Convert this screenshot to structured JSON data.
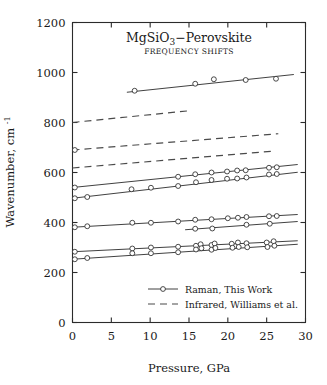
{
  "chart_data": {
    "type": "line",
    "title": "MgSiO3−Perovskite",
    "subtitle": "FREQUENCY SHIFTS",
    "xlabel": "Pressure, GPa",
    "ylabel": "Wavenumber, cm⁻¹",
    "xlim": [
      0,
      30
    ],
    "ylim": [
      0,
      1200
    ],
    "xticks": [
      0,
      5,
      10,
      15,
      20,
      25,
      30
    ],
    "yticks": [
      0,
      200,
      400,
      600,
      800,
      1000,
      1200
    ],
    "grid": false,
    "legend_position": "lower-right-inside",
    "legend": [
      {
        "label": "Raman, This Work",
        "style": "solid-with-open-circle-markers"
      },
      {
        "label": "Infrared, Williams et al.",
        "style": "dashed"
      }
    ],
    "series": [
      {
        "name": "Raman 970",
        "style": "raman",
        "fit": {
          "x": [
            7.0,
            28.5
          ],
          "y": [
            921,
            992
          ]
        },
        "points": [
          {
            "x": 8.0,
            "y": 927
          },
          {
            "x": 15.8,
            "y": 955
          },
          {
            "x": 18.2,
            "y": 973
          },
          {
            "x": 22.3,
            "y": 970
          },
          {
            "x": 26.2,
            "y": 975
          }
        ]
      },
      {
        "name": "Infrared 800",
        "style": "infrared",
        "fit": {
          "x": [
            0.0,
            15.0
          ],
          "y": [
            800,
            847
          ]
        },
        "points": []
      },
      {
        "name": "Infrared 690",
        "style": "infrared",
        "fit": {
          "x": [
            0.0,
            26.5
          ],
          "y": [
            690,
            755
          ]
        },
        "points": [
          {
            "x": 0.3,
            "y": 690
          }
        ]
      },
      {
        "name": "Infrared 618",
        "style": "infrared",
        "fit": {
          "x": [
            0.0,
            26.0
          ],
          "y": [
            618,
            686
          ]
        },
        "points": []
      },
      {
        "name": "Raman 540",
        "style": "raman",
        "fit": {
          "x": [
            0.0,
            29.0
          ],
          "y": [
            540,
            632
          ]
        },
        "points": [
          {
            "x": 0.3,
            "y": 540
          },
          {
            "x": 13.6,
            "y": 583
          },
          {
            "x": 15.8,
            "y": 593
          },
          {
            "x": 17.9,
            "y": 600
          },
          {
            "x": 19.9,
            "y": 604
          },
          {
            "x": 21.2,
            "y": 608
          },
          {
            "x": 22.3,
            "y": 609
          },
          {
            "x": 25.3,
            "y": 619
          },
          {
            "x": 26.3,
            "y": 621
          }
        ]
      },
      {
        "name": "Raman 497",
        "style": "raman",
        "fit": {
          "x": [
            0.0,
            29.0
          ],
          "y": [
            497,
            601
          ]
        },
        "points": [
          {
            "x": 0.3,
            "y": 497
          },
          {
            "x": 1.9,
            "y": 502
          },
          {
            "x": 7.6,
            "y": 533
          },
          {
            "x": 10.1,
            "y": 539
          },
          {
            "x": 13.6,
            "y": 546
          },
          {
            "x": 15.9,
            "y": 561
          },
          {
            "x": 17.9,
            "y": 570
          },
          {
            "x": 19.9,
            "y": 575
          },
          {
            "x": 21.2,
            "y": 576
          },
          {
            "x": 22.4,
            "y": 580
          },
          {
            "x": 25.3,
            "y": 592
          },
          {
            "x": 26.3,
            "y": 594
          }
        ]
      },
      {
        "name": "Raman 381",
        "style": "raman",
        "fit": {
          "x": [
            0.0,
            29.0
          ],
          "y": [
            381,
            432
          ]
        },
        "points": [
          {
            "x": 0.3,
            "y": 381
          },
          {
            "x": 1.9,
            "y": 385
          },
          {
            "x": 7.7,
            "y": 399
          },
          {
            "x": 10.1,
            "y": 399
          },
          {
            "x": 13.6,
            "y": 404
          },
          {
            "x": 15.8,
            "y": 411
          },
          {
            "x": 17.9,
            "y": 413
          },
          {
            "x": 20.0,
            "y": 417
          },
          {
            "x": 21.3,
            "y": 419
          },
          {
            "x": 22.4,
            "y": 422
          },
          {
            "x": 25.3,
            "y": 425
          },
          {
            "x": 26.3,
            "y": 426
          }
        ]
      },
      {
        "name": "Raman 372",
        "style": "raman",
        "fit": {
          "x": [
            14.5,
            29.0
          ],
          "y": [
            371,
            404
          ]
        },
        "points": [
          {
            "x": 15.8,
            "y": 375
          },
          {
            "x": 18.0,
            "y": 376
          },
          {
            "x": 22.4,
            "y": 391
          },
          {
            "x": 25.4,
            "y": 395
          }
        ]
      },
      {
        "name": "Raman 283",
        "style": "raman",
        "fit": {
          "x": [
            0.0,
            29.0
          ],
          "y": [
            283,
            327
          ]
        },
        "points": [
          {
            "x": 0.3,
            "y": 283
          },
          {
            "x": 7.7,
            "y": 296
          },
          {
            "x": 10.1,
            "y": 300
          },
          {
            "x": 13.6,
            "y": 303
          },
          {
            "x": 15.9,
            "y": 307
          },
          {
            "x": 16.5,
            "y": 313
          },
          {
            "x": 17.9,
            "y": 310
          },
          {
            "x": 18.3,
            "y": 316
          },
          {
            "x": 20.5,
            "y": 315
          },
          {
            "x": 21.3,
            "y": 320
          },
          {
            "x": 22.4,
            "y": 317
          },
          {
            "x": 25.0,
            "y": 320
          },
          {
            "x": 25.9,
            "y": 325
          }
        ]
      },
      {
        "name": "Raman 253",
        "style": "raman",
        "fit": {
          "x": [
            0.0,
            29.0
          ],
          "y": [
            253,
            313
          ]
        },
        "points": [
          {
            "x": 0.3,
            "y": 253
          },
          {
            "x": 1.9,
            "y": 258
          },
          {
            "x": 7.7,
            "y": 277
          },
          {
            "x": 10.1,
            "y": 277
          },
          {
            "x": 13.6,
            "y": 281
          },
          {
            "x": 15.9,
            "y": 292
          },
          {
            "x": 16.6,
            "y": 297
          },
          {
            "x": 17.9,
            "y": 291
          },
          {
            "x": 18.4,
            "y": 298
          },
          {
            "x": 20.6,
            "y": 299
          },
          {
            "x": 21.4,
            "y": 302
          },
          {
            "x": 22.5,
            "y": 301
          },
          {
            "x": 25.1,
            "y": 302
          },
          {
            "x": 26.0,
            "y": 307
          }
        ]
      }
    ]
  }
}
